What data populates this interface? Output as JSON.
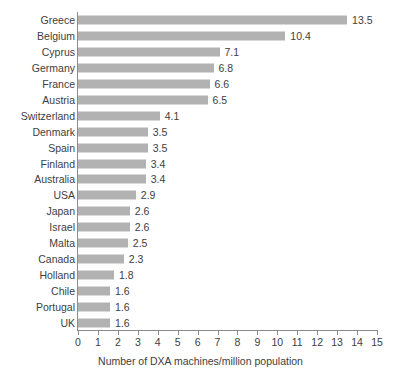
{
  "chart_data": {
    "type": "bar",
    "orientation": "horizontal",
    "title": "",
    "xlabel": "Number of DXA machines/million population",
    "ylabel": "",
    "xlim": [
      0,
      15
    ],
    "xticks": [
      "0",
      "1",
      "2",
      "3",
      "4",
      "5",
      "6",
      "7",
      "8",
      "9",
      "10",
      "11",
      "12",
      "13",
      "14",
      "15"
    ],
    "grid": false,
    "legend": null,
    "bar_color": "#b2b2b2",
    "text_color": "#3e3e3e",
    "axis_color": "#8c8c8c",
    "background": "#ffffff",
    "categories": [
      "Greece",
      "Belgium",
      "Cyprus",
      "Germany",
      "France",
      "Austria",
      "Switzerland",
      "Denmark",
      "Spain",
      "Finland",
      "Australia",
      "USA",
      "Japan",
      "Israel",
      "Malta",
      "Canada",
      "Holland",
      "Chile",
      "Portugal",
      "UK"
    ],
    "values": [
      13.5,
      10.4,
      7.1,
      6.8,
      6.6,
      6.5,
      4.1,
      3.5,
      3.5,
      3.4,
      3.4,
      2.9,
      2.6,
      2.6,
      2.5,
      2.3,
      1.8,
      1.6,
      1.6,
      1.6
    ],
    "value_labels": [
      "13.5",
      "10.4",
      "7.1",
      "6.8",
      "6.6",
      "6.5",
      "4.1",
      "3.5",
      "3.5",
      "3.4",
      "3.4",
      "2.9",
      "2.6",
      "2.6",
      "2.5",
      "2.3",
      "1.8",
      "1.6",
      "1.6",
      "1.6"
    ]
  }
}
